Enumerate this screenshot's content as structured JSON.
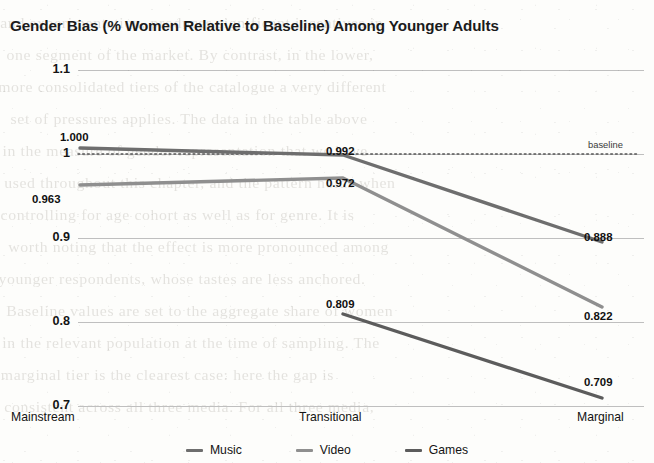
{
  "chart_data": {
    "type": "line",
    "title": "Gender Bias (% Women Relative to Baseline) Among Younger Adults",
    "xlabel": "",
    "ylabel": "",
    "categories": [
      "Mainstream",
      "Transitional",
      "Marginal"
    ],
    "series": [
      {
        "name": "Music",
        "values": [
          1.0,
          0.992,
          0.888
        ],
        "labels": [
          "1.000",
          "0.992",
          "0.888"
        ],
        "color": "#6e6e6e"
      },
      {
        "name": "Video",
        "values": [
          0.963,
          0.972,
          0.822
        ],
        "labels": [
          "0.963",
          "0.972",
          "0.822"
        ],
        "color": "#8a8a8a"
      },
      {
        "name": "Games",
        "values": [
          null,
          0.809,
          0.709
        ],
        "labels": [
          "",
          "0.809",
          "0.709"
        ],
        "color": "#5c5c5c"
      }
    ],
    "ylim": [
      0.7,
      1.1
    ],
    "yticks": [
      "1.1",
      "1",
      "0.9",
      "0.8",
      "0.7"
    ],
    "ytick_values": [
      1.1,
      1.0,
      0.9,
      0.8,
      0.7
    ],
    "grid": true,
    "legend_position": "bottom",
    "annotations": [
      {
        "name": "baseline",
        "text": "baseline",
        "y": 1.0,
        "style": "dotted-horizontal-line"
      }
    ]
  },
  "axis": {
    "ytick_0": "1.1",
    "ytick_1": "1",
    "ytick_2": "0.9",
    "ytick_3": "0.8",
    "ytick_4": "0.7",
    "xtick_0": "Mainstream",
    "xtick_1": "Transitional",
    "xtick_2": "Marginal"
  },
  "point_labels": {
    "music_mainstream": "1.000",
    "music_transitional": "0.992",
    "music_marginal": "0.888",
    "video_mainstream": "0.963",
    "video_transitional": "0.972",
    "video_marginal": "0.822",
    "games_transitional": "0.809",
    "games_marginal": "0.709"
  },
  "baseline_tag": "baseline",
  "legend": {
    "items": [
      {
        "label": "Music"
      },
      {
        "label": "Video"
      },
      {
        "label": "Games"
      }
    ]
  },
  "background_text": {
    "lines": [
      "and experimentation, produces significant incentives in",
      "one segment of the market. By contrast, in the lower,",
      "more consolidated tiers of the catalogue a very different",
      "set of pressures applies. The data in the table above",
      "in the measure of gender representation that we have",
      "used throughout this chapter, and the pattern holds when",
      "controlling for age cohort as well as for genre. It is",
      "worth noting that the effect is more pronounced among",
      "younger respondents, whose tastes are less anchored.",
      "Baseline values are set to the aggregate share of women",
      "in the relevant population at the time of sampling. The",
      "marginal tier is the clearest case: here the gap is",
      "consistent across all three media. For all three media,"
    ]
  }
}
